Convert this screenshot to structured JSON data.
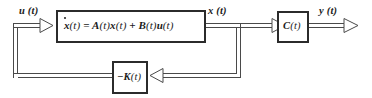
{
  "diagram": {
    "colors": {
      "line": "#4a4a4a",
      "box_border": "#2b2b2b",
      "text": "#1b1b1b",
      "background": "#ffffff"
    },
    "signals": {
      "input": "u (t)",
      "state": "x (t)",
      "output": "y (t)"
    },
    "blocks": {
      "plant": {
        "name": "state-equation-block",
        "equation_parts": {
          "xdot": "x",
          "xdot_arg": "(t)",
          "equals": "=",
          "a": "A",
          "a_arg": "(t)",
          "x": "x",
          "x_arg": "(t)",
          "plus": "+",
          "b": "B",
          "b_arg": "(t)",
          "u": "u",
          "u_arg": "(t)"
        },
        "equation_text": "ẋ (t) = A (t) x (t) + B (t) u (t)"
      },
      "output_gain": {
        "name": "output-matrix-block",
        "symbol": "C",
        "arg": "(t)",
        "label": "C (t)"
      },
      "feedback_gain": {
        "name": "feedback-gain-block",
        "sign": "−",
        "symbol": "K",
        "arg": "(t)",
        "label": "−K (t)"
      }
    },
    "arrows": [
      {
        "name": "input-arrow",
        "from": "feedback-sum",
        "to": "state-equation-block"
      },
      {
        "name": "state-arrow",
        "from": "state-equation-block",
        "to": "output-matrix-block"
      },
      {
        "name": "output-arrow",
        "from": "output-matrix-block",
        "to": "output-terminal"
      },
      {
        "name": "feedback-arrow",
        "from": "state-tap",
        "to": "feedback-gain-block"
      }
    ]
  }
}
